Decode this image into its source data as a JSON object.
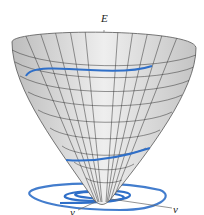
{
  "diagram": {
    "type": "3d-surface-paraboloid",
    "axes": {
      "vertical": "E",
      "right": "v",
      "front": "y"
    },
    "colors": {
      "surface": "#d8d8d8",
      "grid": "#333333",
      "curve": "#2f6fc8"
    }
  }
}
